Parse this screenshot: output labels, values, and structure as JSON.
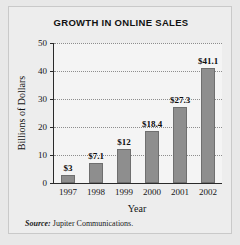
{
  "chart_data": {
    "type": "bar",
    "title": "GROWTH IN ONLINE SALES",
    "xlabel": "Year",
    "ylabel": "Billions of Dollars",
    "categories": [
      "1997",
      "1998",
      "1999",
      "2000",
      "2001",
      "2002"
    ],
    "values": [
      3,
      7.1,
      12,
      18.4,
      27.3,
      41.1
    ],
    "data_labels": [
      "$3",
      "$7.1",
      "$12",
      "$18.4",
      "$27.3",
      "$41.1"
    ],
    "ylim": [
      0,
      50
    ],
    "yticks": [
      0,
      10,
      20,
      30,
      40,
      50
    ],
    "ytick_labels": [
      "0",
      "10",
      "20",
      "30",
      "40",
      "50"
    ],
    "grid": "horizontal-dotted",
    "legend": "none",
    "bar_color": "#8e8e8e",
    "plot_background": "#f4f4f4",
    "panel_background": "#ededed",
    "axis_color": "#2a2a2a"
  },
  "source": {
    "label": "Source:",
    "text": "Jupiter Communications."
  }
}
